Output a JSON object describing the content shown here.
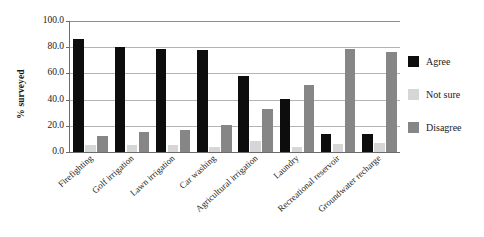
{
  "chart_data": {
    "type": "bar",
    "title": "",
    "subtitle": "",
    "xlabel": "",
    "ylabel": "% surveyed",
    "ylim": [
      0,
      100
    ],
    "yticks": [
      "0.0",
      "20.0",
      "40.0",
      "60.0",
      "80.0",
      "100.0"
    ],
    "ytick_values": [
      0,
      20,
      40,
      60,
      80,
      100
    ],
    "grid": true,
    "grid_axis": "y",
    "legend_position": "right",
    "orientation": "vertical",
    "grouping": "grouped",
    "categories": [
      "Firefighting",
      "Golf irrigation",
      "Lawn irrigation",
      "Car washing",
      "Agricultural irrigation",
      "Laundry",
      "Recreational reservoir",
      "Groundwater recharge"
    ],
    "series": [
      {
        "name": "Agree",
        "color": "#0d0d0d",
        "values": [
          86,
          80.5,
          79,
          77.5,
          58,
          40.5,
          14,
          14
        ]
      },
      {
        "name": "Not sure",
        "color": "#d6d6d6",
        "values": [
          5.5,
          5.5,
          5,
          4,
          8.5,
          4,
          6,
          7
        ]
      },
      {
        "name": "Disagree",
        "color": "#868686",
        "values": [
          12.5,
          15,
          16.5,
          20.5,
          33,
          51,
          78.5,
          76.5
        ]
      }
    ],
    "annotations": []
  },
  "legend": {
    "items": [
      {
        "label": "Agree",
        "color": "#0d0d0d"
      },
      {
        "label": "Not sure",
        "color": "#d6d6d6"
      },
      {
        "label": "Disagree",
        "color": "#868686"
      }
    ]
  },
  "colors": {
    "agree": "#0d0d0d",
    "not_sure": "#d6d6d6",
    "disagree": "#868686",
    "gridline": "#b4b4b4",
    "axis": "#6b6b6b",
    "background": "#ffffff",
    "text": "#1a1a1a"
  }
}
